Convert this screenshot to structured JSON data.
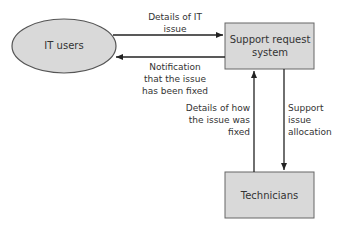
{
  "diagram": {
    "nodes": {
      "it_users": {
        "label": "IT users",
        "shape": "ellipse"
      },
      "support_system": {
        "label": "Support request system",
        "shape": "rectangle"
      },
      "technicians": {
        "label": "Technicians",
        "shape": "rectangle"
      }
    },
    "flows": [
      {
        "from": "it_users",
        "to": "support_system",
        "label_line1": "Details of IT",
        "label_line2": "issue"
      },
      {
        "from": "support_system",
        "to": "it_users",
        "label_line1": "Notification",
        "label_line2": "that the issue",
        "label_line3": "has been fixed"
      },
      {
        "from": "technicians",
        "to": "support_system",
        "label_line1": "Details of how",
        "label_line2": "the issue was",
        "label_line3": "fixed"
      },
      {
        "from": "support_system",
        "to": "technicians",
        "label_line1": "Support",
        "label_line2": "issue",
        "label_line3": "allocation"
      }
    ],
    "colors": {
      "fill": "#d9d9d9",
      "stroke": "#555555",
      "text": "#333333"
    }
  }
}
